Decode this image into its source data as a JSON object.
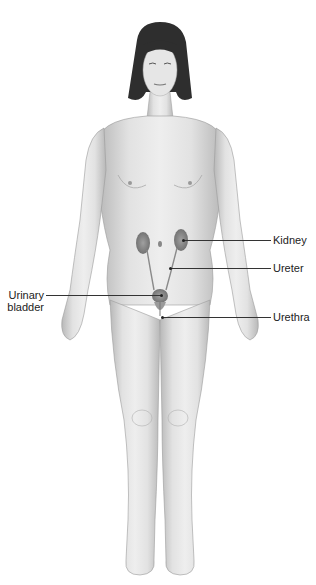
{
  "diagram": {
    "labels": {
      "kidney": "Kidney",
      "ureter": "Ureter",
      "urinary_bladder_line1": "Urinary",
      "urinary_bladder_line2": "bladder",
      "urethra": "Urethra"
    },
    "colors": {
      "skin": "#e4e4e4",
      "skin_shadow": "#bdbdbd",
      "hair": "#2e2e2e",
      "organ": "#8a8a8a",
      "leader_line": "#333333"
    }
  }
}
